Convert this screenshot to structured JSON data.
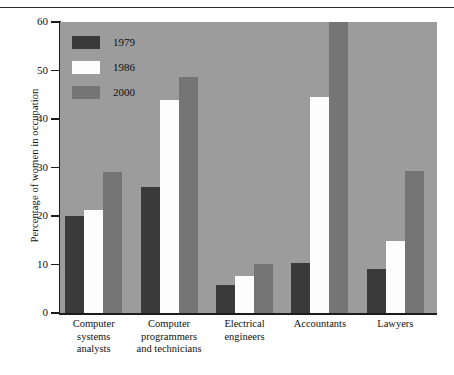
{
  "chart_data": {
    "type": "bar",
    "title": "",
    "xlabel": "",
    "ylabel": "Percentage of women in occupation",
    "ylim": [
      0,
      60
    ],
    "yticks": [
      0,
      10,
      20,
      30,
      40,
      50,
      60
    ],
    "grid": false,
    "legend_position": "top-left",
    "categories": [
      "Computer systems analysts",
      "Computer programmers and technicians",
      "Electrical engineers",
      "Accountants",
      "Lawyers"
    ],
    "category_lines": [
      [
        "Computer",
        "systems",
        "analysts"
      ],
      [
        "Computer",
        "programmers",
        "and technicians"
      ],
      [
        "Electrical",
        "engineers"
      ],
      [
        "Accountants"
      ],
      [
        "Lawyers"
      ]
    ],
    "series": [
      {
        "name": "1979",
        "color": "#3a3a3a",
        "values": [
          20.0,
          26.0,
          5.8,
          10.3,
          9.0
        ]
      },
      {
        "name": "1986",
        "color": "#fdfdfd",
        "values": [
          21.3,
          44.0,
          7.6,
          44.6,
          14.8
        ]
      },
      {
        "name": "2000",
        "color": "#757575",
        "values": [
          29.0,
          48.7,
          10.1,
          60.0,
          29.2
        ]
      }
    ]
  },
  "colors": {
    "plot_background": "#9c9c9c",
    "page_background": "#ffffff",
    "axis": "#1c1c1c",
    "text": "#111111"
  }
}
